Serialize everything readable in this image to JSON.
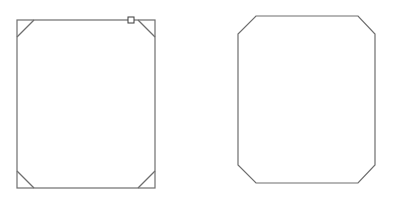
{
  "canvas": {
    "width": 393,
    "height": 202,
    "background": "#ffffff"
  },
  "colors": {
    "stroke": "#6e6e6e",
    "handle_stroke": "#3a3a3a"
  },
  "shapes": [
    {
      "name": "rectangle-with-corner-bevel-guides",
      "type": "rectangle",
      "x": 17,
      "y": 20,
      "width": 138,
      "height": 168,
      "corner_guides": [
        {
          "corner": "top-left",
          "x1": 34,
          "y1": 20,
          "x2": 17,
          "y2": 37
        },
        {
          "corner": "top-right",
          "x1": 138,
          "y1": 20,
          "x2": 155,
          "y2": 37
        },
        {
          "corner": "bottom-left",
          "x1": 17,
          "y1": 171,
          "x2": 34,
          "y2": 188
        },
        {
          "corner": "bottom-right",
          "x1": 155,
          "y1": 171,
          "x2": 138,
          "y2": 188
        }
      ],
      "selection_handle": {
        "x": 128,
        "y": 17,
        "size": 6
      }
    },
    {
      "name": "chamfered-rectangle",
      "type": "octagon",
      "points": [
        [
          256,
          16
        ],
        [
          358,
          16
        ],
        [
          375,
          34
        ],
        [
          375,
          165
        ],
        [
          358,
          183
        ],
        [
          256,
          183
        ],
        [
          238,
          165
        ],
        [
          238,
          34
        ]
      ]
    }
  ]
}
